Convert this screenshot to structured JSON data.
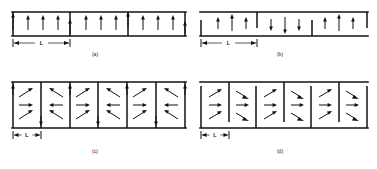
{
  "figure": {
    "ink_color": "#111111",
    "background_color": "#ffffff"
  },
  "panels": [
    {
      "id": "a",
      "caption": "(a)",
      "dimension_label": "L",
      "dimension_span_domains": 1,
      "domain_count": 3,
      "arrow_style": "vertical",
      "domains": [
        {
          "direction": "up",
          "arrow_count": 4
        },
        {
          "direction": "up",
          "arrow_count": 4
        },
        {
          "direction": "up",
          "arrow_count": 4
        }
      ]
    },
    {
      "id": "b",
      "caption": "(b)",
      "dimension_label": "L",
      "dimension_span_domains": 1,
      "domain_count": 3,
      "arrow_style": "vertical",
      "domains": [
        {
          "direction": "up",
          "arrow_count": 3
        },
        {
          "direction": "down",
          "arrow_count": 3
        },
        {
          "direction": "up",
          "arrow_count": 3
        }
      ]
    },
    {
      "id": "c",
      "caption": "(c)",
      "dimension_label": "L",
      "dimension_span_domains": 1,
      "domain_count": 6,
      "arrow_style": "flux-closure",
      "domains": [
        {
          "direction": "right"
        },
        {
          "direction": "left"
        },
        {
          "direction": "right"
        },
        {
          "direction": "left"
        },
        {
          "direction": "right"
        },
        {
          "direction": "left"
        }
      ]
    },
    {
      "id": "d",
      "caption": "(d)",
      "dimension_label": "L",
      "dimension_span_domains": 1,
      "domain_count": 6,
      "arrow_style": "flux-closure",
      "domains": [
        {
          "direction": "right"
        },
        {
          "direction": "right"
        },
        {
          "direction": "right"
        },
        {
          "direction": "right"
        },
        {
          "direction": "right"
        },
        {
          "direction": "right"
        }
      ]
    }
  ]
}
